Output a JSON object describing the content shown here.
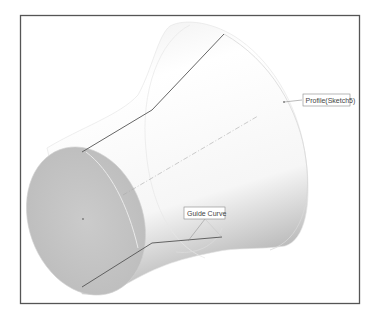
{
  "figure": {
    "labels": {
      "profile": "Profile(Sketch5)",
      "guide_curve": "Guide Curve"
    },
    "colors": {
      "frame": "#555555",
      "body_light": "#ffffff",
      "body_shade": "#c8c8c8",
      "end_face": "#c4c4c4",
      "guide_line": "#555555",
      "profile_edge": "#d6d6d6",
      "axis": "#aaaaaa"
    }
  }
}
